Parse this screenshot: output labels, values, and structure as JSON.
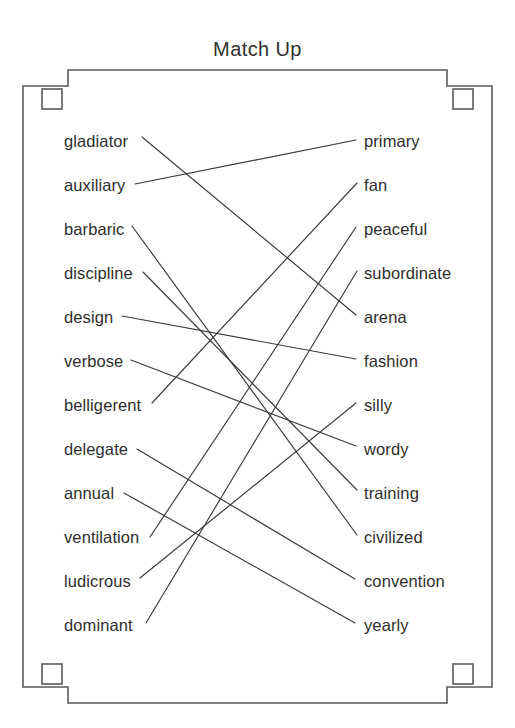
{
  "worksheet": {
    "title": "Match Up",
    "ink_color": "#3a3a3a",
    "frame_color": "#5a5a5a",
    "background_color": "#ffffff"
  },
  "left_column": [
    {
      "label": "gladiator",
      "y": 141
    },
    {
      "label": "auxiliary",
      "y": 185
    },
    {
      "label": "barbaric",
      "y": 229
    },
    {
      "label": "discipline",
      "y": 273
    },
    {
      "label": "design",
      "y": 317
    },
    {
      "label": "verbose",
      "y": 361
    },
    {
      "label": "belligerent",
      "y": 405
    },
    {
      "label": "delegate",
      "y": 449
    },
    {
      "label": "annual",
      "y": 493
    },
    {
      "label": "ventilation",
      "y": 537
    },
    {
      "label": "ludicrous",
      "y": 581
    },
    {
      "label": "dominant",
      "y": 625
    }
  ],
  "right_column": [
    {
      "label": "primary",
      "y": 141
    },
    {
      "label": "fan",
      "y": 185
    },
    {
      "label": "peaceful",
      "y": 229
    },
    {
      "label": "subordinate",
      "y": 273
    },
    {
      "label": "arena",
      "y": 317
    },
    {
      "label": "fashion",
      "y": 361
    },
    {
      "label": "silly",
      "y": 405
    },
    {
      "label": "wordy",
      "y": 449
    },
    {
      "label": "training",
      "y": 493
    },
    {
      "label": "civilized",
      "y": 537
    },
    {
      "label": "convention",
      "y": 581
    },
    {
      "label": "yearly",
      "y": 625
    }
  ],
  "connections": [
    {
      "from": "gladiator",
      "to": "arena",
      "x1": 142,
      "y1": 137,
      "x2": 356,
      "y2": 315
    },
    {
      "from": "auxiliary",
      "to": "primary",
      "x1": 135,
      "y1": 184,
      "x2": 356,
      "y2": 140
    },
    {
      "from": "barbaric",
      "to": "civilized",
      "x1": 132,
      "y1": 226,
      "x2": 357,
      "y2": 535
    },
    {
      "from": "discipline",
      "to": "training",
      "x1": 143,
      "y1": 272,
      "x2": 357,
      "y2": 490
    },
    {
      "from": "design",
      "to": "fashion",
      "x1": 122,
      "y1": 316,
      "x2": 356,
      "y2": 359
    },
    {
      "from": "verbose",
      "to": "wordy",
      "x1": 131,
      "y1": 360,
      "x2": 356,
      "y2": 446
    },
    {
      "from": "belligerent",
      "to": "fan",
      "x1": 152,
      "y1": 403,
      "x2": 357,
      "y2": 183
    },
    {
      "from": "delegate",
      "to": "convention",
      "x1": 137,
      "y1": 449,
      "x2": 355,
      "y2": 579
    },
    {
      "from": "annual",
      "to": "yearly",
      "x1": 124,
      "y1": 493,
      "x2": 355,
      "y2": 623
    },
    {
      "from": "ventilation",
      "to": "peaceful",
      "x1": 150,
      "y1": 537,
      "x2": 356,
      "y2": 227
    },
    {
      "from": "ludicrous",
      "to": "silly",
      "x1": 140,
      "y1": 578,
      "x2": 356,
      "y2": 403
    },
    {
      "from": "dominant",
      "to": "subordinate",
      "x1": 146,
      "y1": 623,
      "x2": 357,
      "y2": 271
    }
  ],
  "frame": {
    "name": "decorative-border",
    "corner_count": 4
  }
}
